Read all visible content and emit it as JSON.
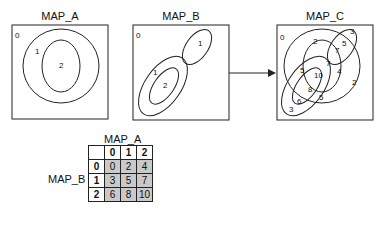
{
  "maps": {
    "a": {
      "title": "MAP_A",
      "labels": [
        "0",
        "1",
        "2"
      ]
    },
    "b": {
      "title": "MAP_B",
      "labels": [
        "0",
        "1",
        "1",
        "2"
      ]
    },
    "c": {
      "title": "MAP_C",
      "labels": [
        "0",
        "2",
        "3",
        "5",
        "7",
        "7",
        "4",
        "2",
        "5",
        "10",
        "8",
        "6",
        "5",
        "3"
      ]
    }
  },
  "arrow": {
    "direction": "right"
  },
  "matrix": {
    "col_header": "MAP_A",
    "row_header": "MAP_B",
    "cols": [
      "0",
      "1",
      "2"
    ],
    "rows": [
      {
        "label": "0",
        "values": [
          "0",
          "2",
          "4"
        ]
      },
      {
        "label": "1",
        "values": [
          "3",
          "5",
          "7"
        ]
      },
      {
        "label": "2",
        "values": [
          "6",
          "8",
          "10"
        ]
      }
    ]
  },
  "colors": {
    "line": "#222222",
    "cell_fill": "#c9c9c9"
  }
}
